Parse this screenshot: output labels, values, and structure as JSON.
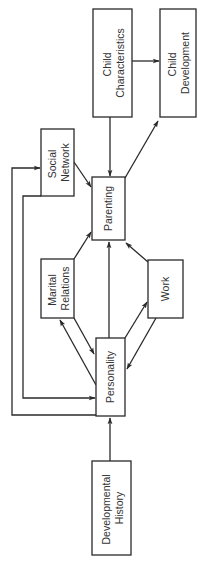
{
  "diagram": {
    "orientation": "rotated-90-ccw",
    "stroke_color": "#2a2a2a",
    "background": "#ffffff",
    "nodes": [
      {
        "id": "child_characteristics",
        "lines": [
          "Child",
          "Characteristics"
        ]
      },
      {
        "id": "child_development",
        "lines": [
          "Child",
          "Development"
        ]
      },
      {
        "id": "social_network",
        "lines": [
          "Social",
          "Network"
        ]
      },
      {
        "id": "parenting",
        "lines": [
          "Parenting"
        ]
      },
      {
        "id": "marital_relations",
        "lines": [
          "Marital",
          "Relations"
        ]
      },
      {
        "id": "work",
        "lines": [
          "Work"
        ]
      },
      {
        "id": "personality",
        "lines": [
          "Personality"
        ]
      },
      {
        "id": "developmental_history",
        "lines": [
          "Developmental",
          "History"
        ]
      }
    ],
    "edges": [
      {
        "from": "child_characteristics",
        "to": "child_development"
      },
      {
        "from": "child_characteristics",
        "to": "parenting"
      },
      {
        "from": "parenting",
        "to": "child_development"
      },
      {
        "from": "social_network",
        "to": "parenting"
      },
      {
        "from": "marital_relations",
        "to": "parenting"
      },
      {
        "from": "personality",
        "to": "parenting"
      },
      {
        "from": "work",
        "to": "parenting"
      },
      {
        "from": "personality",
        "to": "marital_relations"
      },
      {
        "from": "marital_relations",
        "to": "personality"
      },
      {
        "from": "personality",
        "to": "work"
      },
      {
        "from": "work",
        "to": "personality"
      },
      {
        "from": "personality",
        "to": "social_network"
      },
      {
        "from": "social_network",
        "to": "personality"
      },
      {
        "from": "developmental_history",
        "to": "personality"
      }
    ]
  },
  "labels": {
    "child_characteristics": {
      "line1": "Child",
      "line2": "Characteristics"
    },
    "child_development": {
      "line1": "Child",
      "line2": "Development"
    },
    "social_network": {
      "line1": "Social",
      "line2": "Network"
    },
    "parenting": {
      "line1": "Parenting"
    },
    "marital_relations": {
      "line1": "Marital",
      "line2": "Relations"
    },
    "work": {
      "line1": "Work"
    },
    "personality": {
      "line1": "Personality"
    },
    "developmental_history": {
      "line1": "Developmental",
      "line2": "History"
    }
  }
}
